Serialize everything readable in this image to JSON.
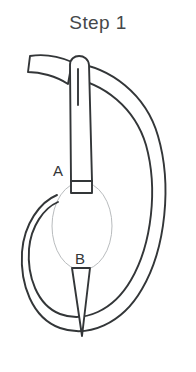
{
  "title": "Step 1",
  "illustration": {
    "name": "needle-and-thread-loop-diagram",
    "description": "Sewing needle threaded through fabric with thread looped around",
    "labels": {
      "a": "A",
      "b": "B"
    },
    "colors": {
      "stroke": "#333638",
      "light_stroke": "#b9bcbe",
      "fill": "#ffffff",
      "text": "#45484a",
      "background": "#ffffff"
    },
    "parts": [
      "thread-tail",
      "needle-eye",
      "needle-shaft",
      "needle-point",
      "thread-loop-outer",
      "thread-loop-inner",
      "fabric-ellipse"
    ]
  }
}
